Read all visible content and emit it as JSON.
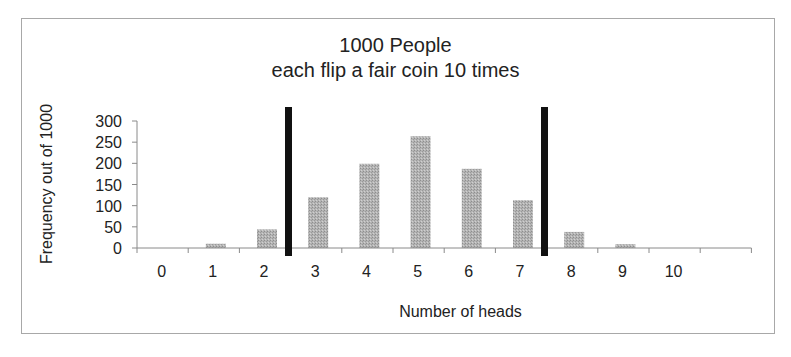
{
  "chart_data": {
    "type": "bar",
    "title": "1000 People\neach flip a fair coin 10 times",
    "title_lines": [
      "1000 People",
      "each flip a fair coin 10 times"
    ],
    "xlabel": "Number of heads",
    "ylabel": "Frequency out of 1000",
    "categories": [
      "0",
      "1",
      "2",
      "3",
      "4",
      "5",
      "6",
      "7",
      "8",
      "9",
      "10"
    ],
    "values": [
      0,
      10,
      44,
      120,
      199,
      264,
      187,
      113,
      38,
      9,
      0
    ],
    "ylim": [
      0,
      300
    ],
    "yticks": [
      0,
      50,
      100,
      150,
      200,
      250,
      300
    ],
    "grid": false,
    "legend": null,
    "annotations": [
      {
        "type": "vertical-line",
        "position": "between 2 and 3",
        "color": "#111111"
      },
      {
        "type": "vertical-line",
        "position": "between 7 and 8",
        "color": "#111111"
      }
    ],
    "bar_color": "#a9a9a9"
  },
  "chart": {
    "title_line1": "1000 People",
    "title_line2": "each flip a fair coin 10 times",
    "xlabel": "Number of heads",
    "ylabel": "Frequency out of 1000"
  }
}
